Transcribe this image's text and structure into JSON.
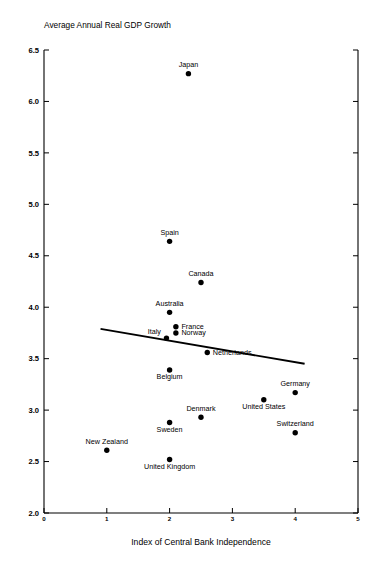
{
  "chart_data": {
    "type": "scatter",
    "title": "Average Annual Real GDP Growth",
    "xlabel": "Index of Central Bank Independence",
    "ylabel": "",
    "xlim": [
      0,
      5
    ],
    "ylim": [
      2.0,
      6.5
    ],
    "xticks": [
      "0",
      "1",
      "2",
      "3",
      "4",
      "5"
    ],
    "yticks": [
      "2.0",
      "2.5",
      "3.0",
      "3.5",
      "4.0",
      "4.5",
      "5.0",
      "5.5",
      "6.0",
      "6.5"
    ],
    "grid": false,
    "legend": null,
    "points": [
      {
        "label": "Japan",
        "x": 2.3,
        "y": 6.27,
        "label_pos": "above"
      },
      {
        "label": "Spain",
        "x": 2.0,
        "y": 4.64,
        "label_pos": "above"
      },
      {
        "label": "Canada",
        "x": 2.5,
        "y": 4.24,
        "label_pos": "above"
      },
      {
        "label": "Australia",
        "x": 2.0,
        "y": 3.95,
        "label_pos": "above"
      },
      {
        "label": "France",
        "x": 2.1,
        "y": 3.81,
        "label_pos": "right"
      },
      {
        "label": "Norway",
        "x": 2.1,
        "y": 3.75,
        "label_pos": "right"
      },
      {
        "label": "Italy",
        "x": 1.95,
        "y": 3.7,
        "label_pos": "left"
      },
      {
        "label": "Netherlands",
        "x": 2.6,
        "y": 3.56,
        "label_pos": "right"
      },
      {
        "label": "Belgium",
        "x": 2.0,
        "y": 3.39,
        "label_pos": "below"
      },
      {
        "label": "Germany",
        "x": 4.0,
        "y": 3.17,
        "label_pos": "above"
      },
      {
        "label": "United States",
        "x": 3.5,
        "y": 3.1,
        "label_pos": "below"
      },
      {
        "label": "Denmark",
        "x": 2.5,
        "y": 2.93,
        "label_pos": "above"
      },
      {
        "label": "Sweden",
        "x": 2.0,
        "y": 2.88,
        "label_pos": "below"
      },
      {
        "label": "Switzerland",
        "x": 4.0,
        "y": 2.78,
        "label_pos": "above"
      },
      {
        "label": "New Zealand",
        "x": 1.0,
        "y": 2.61,
        "label_pos": "above"
      },
      {
        "label": "United Kingdom",
        "x": 2.0,
        "y": 2.52,
        "label_pos": "below"
      }
    ],
    "trendline": {
      "name": "regression-line",
      "x0": 0.9,
      "y0": 3.79,
      "x1": 4.15,
      "y1": 3.45
    }
  }
}
